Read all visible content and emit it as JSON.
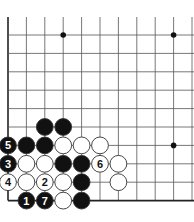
{
  "diagram": {
    "type": "go-board",
    "title": "",
    "grid": {
      "origin_x": 8,
      "origin_y": 35,
      "spacing": 18.4,
      "cols": 11,
      "rows": 10,
      "top_extend_y": 17,
      "left_edge": true,
      "bottom_edge": true
    },
    "colors": {
      "line": "#555555",
      "edge": "#222222",
      "black_stone": "#111111",
      "white_stone": "#ffffff",
      "stone_outline": "#333333"
    },
    "star_points": [
      {
        "col": 3,
        "row": 0
      },
      {
        "col": 9,
        "row": 0
      },
      {
        "col": 9,
        "row": 6
      }
    ],
    "stones": [
      {
        "col": 2,
        "row": 5,
        "color": "black",
        "label": ""
      },
      {
        "col": 3,
        "row": 5,
        "color": "black",
        "label": ""
      },
      {
        "col": 0,
        "row": 6,
        "color": "black",
        "label": "5"
      },
      {
        "col": 1,
        "row": 6,
        "color": "black",
        "label": ""
      },
      {
        "col": 2,
        "row": 6,
        "color": "black",
        "label": ""
      },
      {
        "col": 3,
        "row": 6,
        "color": "white",
        "label": ""
      },
      {
        "col": 4,
        "row": 6,
        "color": "white",
        "label": ""
      },
      {
        "col": 5,
        "row": 6,
        "color": "white",
        "label": ""
      },
      {
        "col": 0,
        "row": 7,
        "color": "black",
        "label": "3"
      },
      {
        "col": 1,
        "row": 7,
        "color": "white",
        "label": ""
      },
      {
        "col": 2,
        "row": 7,
        "color": "white",
        "label": ""
      },
      {
        "col": 3,
        "row": 7,
        "color": "black",
        "label": ""
      },
      {
        "col": 4,
        "row": 7,
        "color": "black",
        "label": ""
      },
      {
        "col": 5,
        "row": 7,
        "color": "white",
        "label": "6"
      },
      {
        "col": 6,
        "row": 7,
        "color": "white",
        "label": ""
      },
      {
        "col": 0,
        "row": 8,
        "color": "white",
        "label": "4"
      },
      {
        "col": 1,
        "row": 8,
        "color": "white",
        "label": ""
      },
      {
        "col": 2,
        "row": 8,
        "color": "white",
        "label": "2"
      },
      {
        "col": 3,
        "row": 8,
        "color": "white",
        "label": ""
      },
      {
        "col": 4,
        "row": 8,
        "color": "black",
        "label": ""
      },
      {
        "col": 6,
        "row": 8,
        "color": "white",
        "label": ""
      },
      {
        "col": 1,
        "row": 9,
        "color": "black",
        "label": "1"
      },
      {
        "col": 2,
        "row": 9,
        "color": "black",
        "label": "7"
      },
      {
        "col": 3,
        "row": 9,
        "color": "white",
        "label": ""
      },
      {
        "col": 4,
        "row": 9,
        "color": "black",
        "label": ""
      }
    ]
  }
}
